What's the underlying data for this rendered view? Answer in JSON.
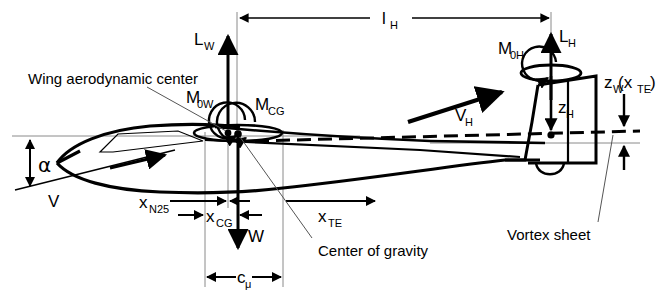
{
  "figure": {
    "type": "technical-diagram",
    "background_color": "#ffffff",
    "line_color": "#000000",
    "thin_line_color": "#888888"
  },
  "labels": {
    "wing_aero_center": "Wing aerodynamic center",
    "center_of_gravity": "Center of gravity",
    "vortex_sheet": "Vortex sheet",
    "lift_wing": "L",
    "lift_wing_sub": "W",
    "lift_tail": "L",
    "lift_tail_sub": "H",
    "moment_wing": "M",
    "moment_wing_sub": "0W",
    "moment_cg": "M",
    "moment_cg_sub": "CG",
    "moment_tail": "M",
    "moment_tail_sub": "0H",
    "weight": "W",
    "velocity": "V",
    "velocity_tail": "V",
    "velocity_tail_sub": "H",
    "alpha": "α",
    "tail_arm": "l",
    "tail_arm_sub": "H",
    "x_n25": "x",
    "x_n25_sub": "N25",
    "x_cg": "x",
    "x_cg_sub": "CG",
    "x_te": "x",
    "x_te_sub": "TE",
    "z_h": "z",
    "z_h_sub": "H",
    "z_w": "z",
    "z_w_sub": "W",
    "z_w_arg": "(x",
    "z_w_arg_sub": "TE",
    "z_w_arg_close": ")",
    "c_mu": "c",
    "c_mu_sub": "μ"
  },
  "geometry": {
    "reference_line_y": 136,
    "aero_center_x": 228,
    "cg_x": 238,
    "tail_ac_x": 551,
    "chord_start_x": 205,
    "chord_end_x": 283,
    "tail_arm_y": 18,
    "alpha_degrees": 8
  }
}
